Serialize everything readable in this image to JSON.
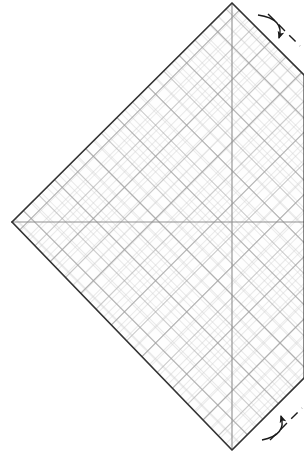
{
  "figure": {
    "type": "technical-line-diagram",
    "canvas": {
      "width": 304,
      "height": 463
    },
    "background_color": "#ffffff"
  },
  "colors": {
    "outline": "#3a3a3a",
    "outline_shadow": "#111111",
    "grid_fine": "#c8c8c8",
    "grid_coarse": "#a8a8a8",
    "axis": "#8f8f8f",
    "arrow": "#1a1a1a",
    "dash": "#1a1a1a",
    "plate_fill": "#fefefe"
  },
  "plate": {
    "name": "rotated-square-plate",
    "description": "Square plate rotated 45 degrees, right corner clipped by frame edge",
    "vertices": [
      {
        "label": "left",
        "x": 12,
        "y": 222
      },
      {
        "label": "top",
        "x": 232,
        "y": 3
      },
      {
        "label": "right-clipped-top",
        "x": 304,
        "y": 75
      },
      {
        "label": "right-clipped-bottom",
        "x": 304,
        "y": 378
      },
      {
        "label": "bottom",
        "x": 232,
        "y": 450
      }
    ],
    "corner_radius": 4,
    "stroke_width": 1.6
  },
  "axes": {
    "center": {
      "x": 232,
      "y": 222
    },
    "horizontal": {
      "name": "horizontal-axis",
      "x1": 13,
      "y1": 222,
      "x2": 304,
      "y2": 222
    },
    "vertical": {
      "name": "vertical-axis",
      "x1": 232,
      "y1": 4,
      "x2": 232,
      "y2": 449
    }
  },
  "grid": {
    "orientation_deg": 45,
    "fine_spacing_px": 11,
    "coarse_spacing_px": 22,
    "secondary_offset_px": 5.5,
    "description": "Two superimposed 45-degree diagonal lattices producing a dense argyle mesh"
  },
  "annotations": [
    {
      "name": "rotation-arrow-top",
      "kind": "curved-arrow",
      "position": {
        "x": 272,
        "y": 26
      },
      "direction": "down-left",
      "label": ""
    },
    {
      "name": "dashed-guide-top",
      "kind": "dashed-line",
      "position": {
        "x": 286,
        "y": 38
      },
      "angle_deg": 45,
      "label": ""
    },
    {
      "name": "rotation-arrow-bottom",
      "kind": "curved-arrow",
      "position": {
        "x": 272,
        "y": 428
      },
      "direction": "up-left",
      "label": ""
    },
    {
      "name": "dashed-guide-bottom",
      "kind": "dashed-line",
      "position": {
        "x": 288,
        "y": 416
      },
      "angle_deg": -45,
      "label": ""
    }
  ]
}
